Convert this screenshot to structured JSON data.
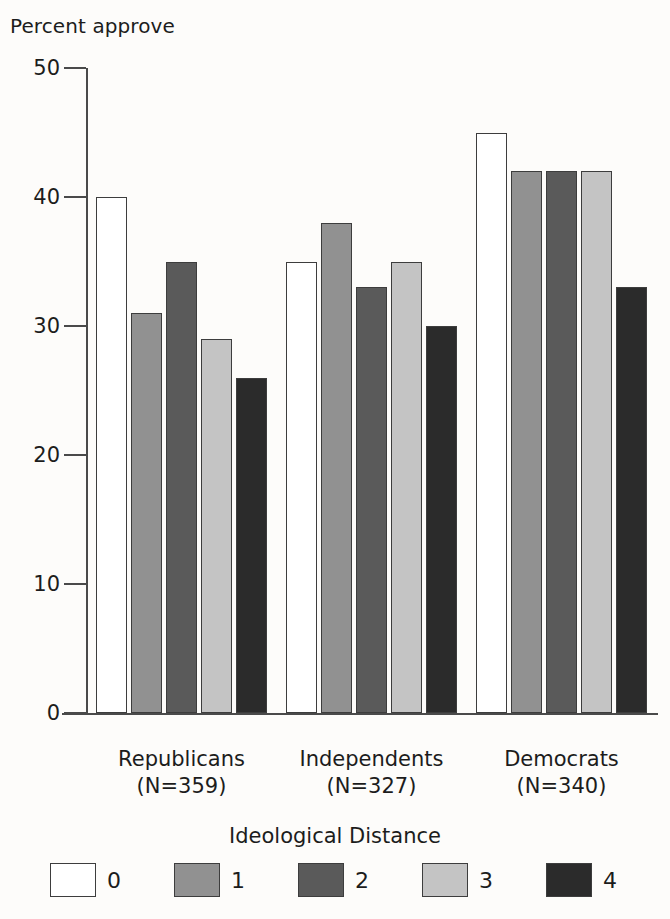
{
  "chart_data": {
    "type": "bar",
    "title": "",
    "xlabel": "",
    "ylabel": "Percent approve",
    "ylim": [
      0,
      50
    ],
    "yticks": [
      0,
      10,
      20,
      30,
      40,
      50
    ],
    "grid": false,
    "legend_position": "bottom",
    "legend_title": "Ideological Distance",
    "categories": [
      "Republicans",
      "Independents",
      "Democrats"
    ],
    "category_sublabels": [
      "(N=359)",
      "(N=327)",
      "(N=340)"
    ],
    "series": [
      {
        "name": "0",
        "color": "#ffffff",
        "values": [
          40,
          35,
          45
        ]
      },
      {
        "name": "1",
        "color": "#919191",
        "values": [
          31,
          38,
          42
        ]
      },
      {
        "name": "2",
        "color": "#5a5a5a",
        "values": [
          35,
          33,
          42
        ]
      },
      {
        "name": "3",
        "color": "#c4c4c4",
        "values": [
          29,
          35,
          42
        ]
      },
      {
        "name": "4",
        "color": "#2b2b2b",
        "values": [
          26,
          30,
          33
        ]
      }
    ]
  },
  "axis": {
    "y_title": "Percent approve",
    "y_tick_labels": [
      "50",
      "40",
      "30",
      "20",
      "10",
      "0"
    ]
  },
  "legend": {
    "title": "Ideological Distance",
    "items": [
      {
        "label": "0",
        "color": "#ffffff"
      },
      {
        "label": "1",
        "color": "#919191"
      },
      {
        "label": "2",
        "color": "#5a5a5a"
      },
      {
        "label": "3",
        "color": "#c4c4c4"
      },
      {
        "label": "4",
        "color": "#2b2b2b"
      }
    ]
  },
  "groups": [
    {
      "name": "Republicans",
      "n_label": "(N=359)"
    },
    {
      "name": "Independents",
      "n_label": "(N=327)"
    },
    {
      "name": "Democrats",
      "n_label": "(N=340)"
    }
  ],
  "colors": {
    "background": "#fdfcfa",
    "axis": "#4a4a4a",
    "text": "#1c1c1c",
    "bar_outline": "#3d3d3d"
  }
}
